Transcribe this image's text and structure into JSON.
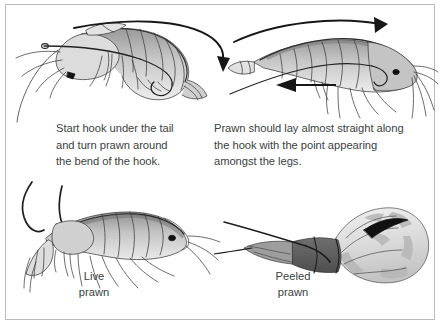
{
  "figure": {
    "background_color": "#ffffff",
    "frame_color": "#b9bcbe",
    "text_color": "#3a3f42"
  },
  "captions": {
    "left": "Start hook under the tail\nand turn prawn around\nthe bend of the hook.",
    "right": "Prawn should lay almost straight along\nthe hook with the point appearing\namongst the legs."
  },
  "labels": {
    "live_prawn": "Live\nprawn",
    "peeled_prawn": "Peeled\nprawn"
  },
  "illustrations": [
    {
      "id": "top-left",
      "name": "prawn-curved-on-hook",
      "description": "Prawn bent around the bend of a hook, viewed from the side, with curved arrow showing rotation direction",
      "annotations": [
        "curved-rotation-arrow"
      ],
      "shading": [
        "#ffffff",
        "#d9d9d9",
        "#b0b0b0",
        "#8a8a8a",
        "#555555"
      ]
    },
    {
      "id": "top-right",
      "name": "prawn-straight-on-hook",
      "description": "Prawn laying almost straight along the hook with the hook point appearing amongst the legs",
      "annotations": [
        "curved-rotation-arrow",
        "straight-left-arrow"
      ],
      "shading": [
        "#ffffff",
        "#d9d9d9",
        "#b0b0b0",
        "#8a8a8a",
        "#555555"
      ]
    },
    {
      "id": "bottom-left",
      "name": "live-prawn-on-hook",
      "description": "Live whole prawn hooked through the tail with the hook shank curving above",
      "annotations": [],
      "shading": [
        "#ffffff",
        "#d4d4d4",
        "#a8a8a8",
        "#7d7d7d",
        "#4a4a4a"
      ]
    },
    {
      "id": "bottom-right",
      "name": "peeled-prawn-on-hook",
      "description": "Peeled prawn body curled on a long-shank hook, hook point emerging near the head",
      "annotations": [],
      "shading": [
        "#ffffff",
        "#e2e2e2",
        "#bdbdbd",
        "#8d8d8d",
        "#4f4f4f"
      ]
    }
  ]
}
